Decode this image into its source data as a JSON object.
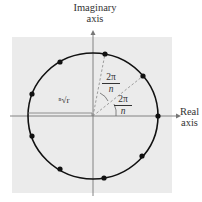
{
  "diagram": {
    "axes": {
      "vertical_label_line1": "Imaginary",
      "vertical_label_line2": "axis",
      "horizontal_label_line1": "Real",
      "horizontal_label_line2": "axis"
    },
    "radius_label": "ⁿ√r",
    "angle_labels": [
      {
        "numerator": "2π",
        "denominator": "n"
      },
      {
        "numerator": "2π",
        "denominator": "n"
      }
    ],
    "num_points": 8,
    "colors": {
      "background_panel": "#ebebeb",
      "circle": "#111111",
      "axes": "#777777",
      "dashed_rays": "#888888",
      "points": "#111111"
    }
  }
}
